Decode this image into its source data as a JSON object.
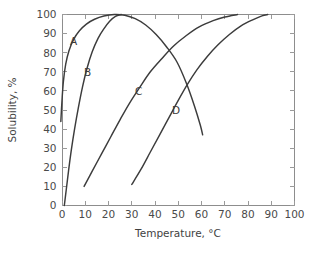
{
  "chart_data": {
    "type": "line",
    "title": "",
    "xlabel": "Temperature, °C",
    "ylabel": "Solubility, %",
    "xlim": [
      0,
      100
    ],
    "ylim": [
      0,
      100
    ],
    "xticks": [
      "0",
      "10",
      "20",
      "30",
      "40",
      "50",
      "60",
      "70",
      "80",
      "90",
      "100"
    ],
    "yticks": [
      "0",
      "10",
      "20",
      "30",
      "40",
      "50",
      "60",
      "70",
      "80",
      "90",
      "100"
    ],
    "grid": false,
    "legend": "inline-curve-labels",
    "series": [
      {
        "name": "A",
        "label_x": 5,
        "label_y": 86,
        "points": [
          [
            -0.5,
            44
          ],
          [
            0.0,
            55
          ],
          [
            0.6,
            65
          ],
          [
            1.6,
            74
          ],
          [
            3.0,
            81
          ],
          [
            5.0,
            87
          ],
          [
            7.5,
            91.5
          ],
          [
            10.5,
            95
          ],
          [
            14.0,
            97.5
          ],
          [
            18.0,
            99.2
          ],
          [
            22.5,
            100
          ],
          [
            27.0,
            99.6
          ],
          [
            31.5,
            97.8
          ],
          [
            36.0,
            94.5
          ],
          [
            40.5,
            89.5
          ],
          [
            45.0,
            83
          ],
          [
            49.5,
            75
          ],
          [
            53.5,
            64
          ],
          [
            57.0,
            52
          ],
          [
            59.5,
            42
          ],
          [
            60.5,
            37
          ]
        ]
      },
      {
        "name": "B",
        "label_x": 11,
        "label_y": 70,
        "points": [
          [
            1.0,
            0
          ],
          [
            1.8,
            8
          ],
          [
            2.8,
            18
          ],
          [
            4.0,
            29
          ],
          [
            5.4,
            40
          ],
          [
            7.0,
            51
          ],
          [
            8.8,
            62
          ],
          [
            10.8,
            72
          ],
          [
            13.0,
            80.5
          ],
          [
            15.5,
            87.5
          ],
          [
            18.0,
            92.5
          ],
          [
            20.5,
            96.5
          ],
          [
            23.0,
            99
          ],
          [
            25.5,
            100
          ]
        ]
      },
      {
        "name": "C",
        "label_x": 33,
        "label_y": 60,
        "points": [
          [
            9.5,
            10
          ],
          [
            13.0,
            18
          ],
          [
            17.0,
            27
          ],
          [
            21.0,
            36
          ],
          [
            25.0,
            45
          ],
          [
            29.0,
            53.5
          ],
          [
            33.5,
            62
          ],
          [
            38.0,
            70
          ],
          [
            43.0,
            77
          ],
          [
            48.0,
            83.5
          ],
          [
            53.5,
            89
          ],
          [
            59.0,
            93.5
          ],
          [
            65.0,
            96.8
          ],
          [
            70.0,
            98.7
          ],
          [
            75.5,
            100
          ]
        ]
      },
      {
        "name": "D",
        "label_x": 49,
        "label_y": 50,
        "points": [
          [
            30.0,
            11
          ],
          [
            34.0,
            19
          ],
          [
            38.0,
            28
          ],
          [
            42.0,
            37
          ],
          [
            46.0,
            46
          ],
          [
            50.0,
            55
          ],
          [
            54.0,
            63.5
          ],
          [
            58.0,
            71
          ],
          [
            62.5,
            78
          ],
          [
            67.0,
            84
          ],
          [
            72.0,
            89.5
          ],
          [
            77.0,
            94
          ],
          [
            82.0,
            97.2
          ],
          [
            86.0,
            99.3
          ],
          [
            88.5,
            100
          ]
        ]
      }
    ]
  }
}
